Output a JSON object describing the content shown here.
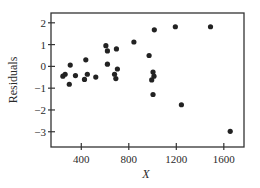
{
  "chart_data": {
    "type": "scatter",
    "title": "",
    "xlabel": "X",
    "ylabel": "Residuals",
    "xlim": [
      145,
      1770
    ],
    "ylim": [
      -3.7,
      2.45
    ],
    "xticks": [
      400,
      800,
      1200,
      1600
    ],
    "yticks": [
      2,
      1,
      0,
      -1,
      -2,
      -3
    ],
    "xtick_labels": [
      "400",
      "800",
      "1200",
      "1600"
    ],
    "ytick_labels": [
      "2",
      "1",
      "0",
      "−1",
      "−2",
      "−3"
    ],
    "grid": false,
    "legend": null,
    "marker_color": "#222222",
    "points": [
      {
        "x": 245,
        "y": -0.45
      },
      {
        "x": 264,
        "y": -0.36
      },
      {
        "x": 307,
        "y": 0.06
      },
      {
        "x": 299,
        "y": -0.82
      },
      {
        "x": 351,
        "y": -0.42
      },
      {
        "x": 438,
        "y": 0.3
      },
      {
        "x": 451,
        "y": -0.36
      },
      {
        "x": 427,
        "y": -0.6
      },
      {
        "x": 522,
        "y": -0.49
      },
      {
        "x": 607,
        "y": 0.95
      },
      {
        "x": 620,
        "y": 0.71
      },
      {
        "x": 696,
        "y": 0.8
      },
      {
        "x": 620,
        "y": 0.1
      },
      {
        "x": 704,
        "y": -0.12
      },
      {
        "x": 680,
        "y": -0.36
      },
      {
        "x": 691,
        "y": -0.56
      },
      {
        "x": 843,
        "y": 1.12
      },
      {
        "x": 971,
        "y": 0.5
      },
      {
        "x": 1004,
        "y": -0.26
      },
      {
        "x": 1012,
        "y": -0.45
      },
      {
        "x": 993,
        "y": -0.62
      },
      {
        "x": 1004,
        "y": -1.29
      },
      {
        "x": 1015,
        "y": 1.68
      },
      {
        "x": 1192,
        "y": 1.82
      },
      {
        "x": 1243,
        "y": -1.76
      },
      {
        "x": 1488,
        "y": 1.82
      },
      {
        "x": 1654,
        "y": -2.98
      }
    ]
  }
}
